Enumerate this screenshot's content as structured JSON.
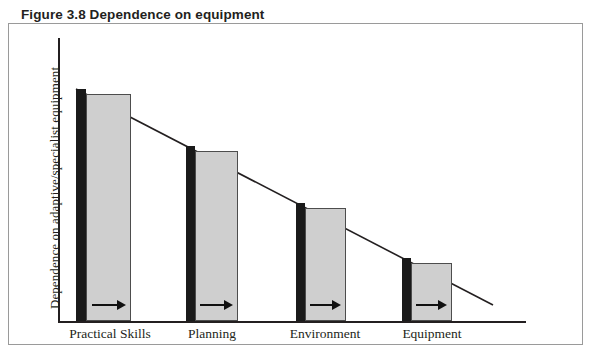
{
  "figure": {
    "title": "Figure 3.8 Dependence on equipment",
    "border_color": "#9a9a9a",
    "background": "#ffffff"
  },
  "axes": {
    "y_axis_label": "Dependence on adaptive/specialist equipment",
    "x_axis_label": "",
    "axis_color": "#231f20"
  },
  "chart_data": {
    "type": "bar",
    "title": "Figure 3.8 Dependence on equipment",
    "xlabel": "",
    "ylabel": "Dependence on adaptive/specialist equipment",
    "categories": [
      "Practical Skills",
      "Planning",
      "Environment",
      "Equipment"
    ],
    "series": [
      {
        "name": "Dependence (black marker bar)",
        "color": "#1a1a1a",
        "values": [
          100,
          78,
          55,
          32
        ]
      },
      {
        "name": "Reduction range (grey bar)",
        "color": "#cfcfcf",
        "values": [
          92,
          71,
          49,
          28
        ]
      }
    ],
    "annotations": [
      {
        "label": "arrow-right",
        "category": "Practical Skills",
        "direction": "right"
      },
      {
        "label": "arrow-right",
        "category": "Planning",
        "direction": "right"
      },
      {
        "label": "arrow-right",
        "category": "Environment",
        "direction": "right"
      },
      {
        "label": "arrow-right",
        "category": "Equipment",
        "direction": "right"
      }
    ],
    "trend": {
      "type": "line",
      "description": "Descending diagonal indicating decreasing dependence",
      "x_start": 76,
      "y_start": 89,
      "x_end": 493,
      "y_end": 305
    },
    "ylim": [
      0,
      100
    ],
    "grid": false,
    "legend": "none"
  },
  "bars": [
    {
      "name": "practical-skills",
      "label": "Practical Skills",
      "black_x": 76,
      "black_w": 10,
      "gray_x": 86,
      "gray_w": 45,
      "top": 89,
      "label_x": 40,
      "label_w": 140,
      "arrow_y": 298
    },
    {
      "name": "planning",
      "label": "Planning",
      "black_x": 186,
      "black_w": 9,
      "gray_x": 195,
      "gray_w": 43,
      "top": 146,
      "label_x": 157,
      "label_w": 110,
      "arrow_y": 298
    },
    {
      "name": "environment",
      "label": "Environment",
      "black_x": 296,
      "black_w": 9,
      "gray_x": 305,
      "gray_w": 41,
      "top": 203,
      "label_x": 265,
      "label_w": 120,
      "arrow_y": 298
    },
    {
      "name": "equipment",
      "label": "Equipment",
      "black_x": 402,
      "black_w": 9,
      "gray_x": 411,
      "gray_w": 41,
      "top": 258,
      "label_x": 373,
      "label_w": 118,
      "arrow_y": 298
    }
  ]
}
